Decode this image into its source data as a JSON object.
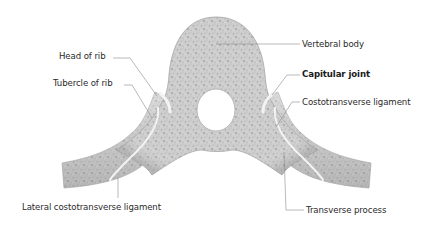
{
  "figure": {
    "colors": {
      "bone_fill": "#c9c9c9",
      "bone_light": "#e4e4e4",
      "bone_dark": "#9a9a9a",
      "joint_highlight": "#f4f4f4",
      "leader_line": "#8a8a8a",
      "label_text": "#2a2a2a",
      "background": "#ffffff"
    },
    "labels": {
      "head_of_rib": "Head of rib",
      "tubercle_of_rib": "Tubercle of rib",
      "lateral_costotransverse_ligament": "Lateral costotransverse ligament",
      "vertebral_body": "Vertebral body",
      "capitular_joint": "Capitular joint",
      "costotransverse_ligament": "Costotransverse ligament",
      "transverse_process": "Transverse process"
    }
  }
}
